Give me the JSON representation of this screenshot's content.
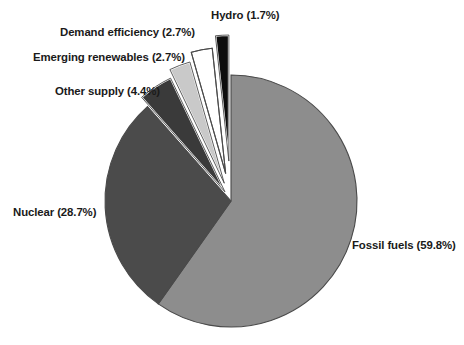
{
  "chart_data": {
    "type": "pie",
    "title": "",
    "subtitle": "",
    "xlabel": "",
    "ylabel": "",
    "legend_position": "none",
    "grid": false,
    "units": "percent",
    "categories": [
      "Fossil fuels",
      "Nuclear",
      "Other supply",
      "Emerging renewables",
      "Demand efficiency",
      "Hydro"
    ],
    "values": [
      59.8,
      28.7,
      4.4,
      2.7,
      2.7,
      1.7
    ],
    "slices": [
      {
        "name": "Fossil fuels",
        "value": 59.8,
        "label": "Fossil fuels (59.8%)",
        "color": "#8d8d8d",
        "exploded": false,
        "start_angle_deg": 0.0,
        "end_angle_deg": 215.28
      },
      {
        "name": "Nuclear",
        "value": 28.7,
        "label": "Nuclear (28.7%)",
        "color": "#4b4b4b",
        "exploded": false,
        "start_angle_deg": 215.28,
        "end_angle_deg": 318.6
      },
      {
        "name": "Other supply",
        "value": 4.4,
        "label": "Other supply (4.4%)",
        "color": "#3a3a3a",
        "exploded": true,
        "start_angle_deg": 318.6,
        "end_angle_deg": 334.44
      },
      {
        "name": "Emerging renewables",
        "value": 2.7,
        "label": "Emerging renewables (2.7%)",
        "color": "#c9c9c9",
        "exploded": true,
        "start_angle_deg": 334.44,
        "end_angle_deg": 344.16
      },
      {
        "name": "Demand efficiency",
        "value": 2.7,
        "label": "Demand efficiency (2.7%)",
        "color": "#ffffff",
        "exploded": true,
        "start_angle_deg": 344.16,
        "end_angle_deg": 353.88
      },
      {
        "name": "Hydro",
        "value": 1.7,
        "label": "Hydro (1.7%)",
        "color": "#0d0d0d",
        "exploded": true,
        "start_angle_deg": 353.88,
        "end_angle_deg": 360.0
      }
    ],
    "total": 100.0,
    "background_color": "#ffffff",
    "outline_color": "#4a4a4a",
    "label_color": "#1a1a1a"
  },
  "labels": {
    "hydro": "Hydro (1.7%)",
    "demand_efficiency": "Demand efficiency (2.7%)",
    "emerging_renewables": "Emerging renewables (2.7%)",
    "other_supply": "Other supply (4.4%)",
    "nuclear": "Nuclear (28.7%)",
    "fossil_fuels": "Fossil fuels (59.8%)"
  }
}
